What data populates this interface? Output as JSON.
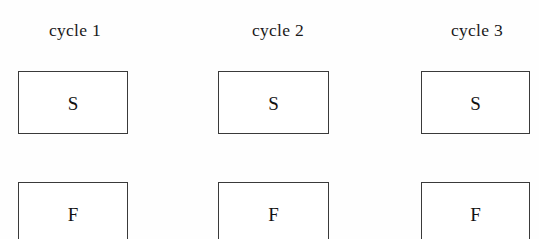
{
  "diagram": {
    "background_color": "#fefefe",
    "line_color": "#3a3a3a",
    "text_color": "#121212",
    "columns": [
      {
        "label": "cycle 1",
        "label_center_x": 75,
        "label_top": 20,
        "box_left": 18,
        "box_width": 110,
        "cells": [
          {
            "letter": "S",
            "top": 71,
            "height": 63
          },
          {
            "letter": "F",
            "top": 182,
            "height": 63
          }
        ]
      },
      {
        "label": "cycle 2",
        "label_center_x": 278,
        "label_top": 20,
        "box_left": 218,
        "box_width": 111,
        "cells": [
          {
            "letter": "S",
            "top": 71,
            "height": 63
          },
          {
            "letter": "F",
            "top": 182,
            "height": 63
          }
        ]
      },
      {
        "label": "cycle 3",
        "label_center_x": 477,
        "label_top": 20,
        "box_left": 421,
        "box_width": 109,
        "cells": [
          {
            "letter": "S",
            "top": 71,
            "height": 63
          },
          {
            "letter": "F",
            "top": 182,
            "height": 63
          }
        ]
      }
    ]
  }
}
